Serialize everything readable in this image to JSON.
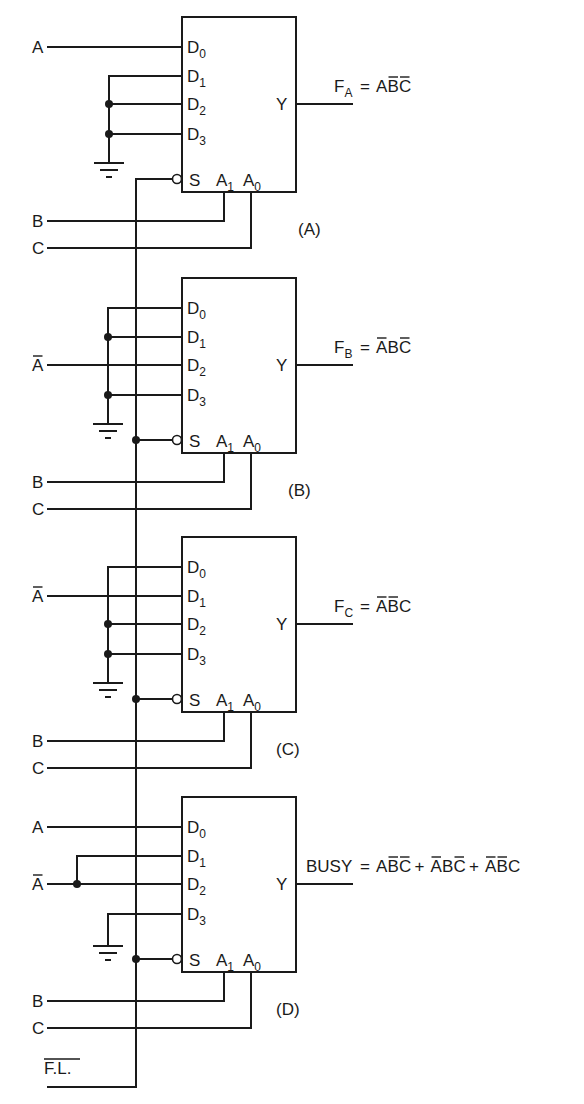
{
  "diagram": {
    "type": "multiplexer-logic-circuit",
    "bus_signal": "F.L.",
    "bus_signal_overbar": true,
    "pin_labels": {
      "data": [
        "D",
        "D",
        "D",
        "D"
      ],
      "data_subs": [
        "0",
        "1",
        "2",
        "3"
      ],
      "output": "Y",
      "strobe": "S",
      "select_1": "A",
      "select_1_sub": "1",
      "select_0": "A",
      "select_0_sub": "0"
    },
    "blocks": [
      {
        "id": "A",
        "caption": "(A)",
        "inputs": [
          {
            "pin": "D0",
            "signal": "A",
            "overbar": false
          },
          {
            "pin": "D1",
            "signal": "GND"
          },
          {
            "pin": "D2",
            "signal": "GND"
          },
          {
            "pin": "D3",
            "signal": "GND"
          }
        ],
        "select": {
          "A1": "B",
          "A0": "C"
        },
        "output": {
          "name": "F",
          "sub": "A",
          "expr": [
            [
              {
                "t": "A",
                "bar": false
              },
              {
                "t": "B",
                "bar": true
              },
              {
                "t": "C",
                "bar": true
              }
            ]
          ]
        }
      },
      {
        "id": "B",
        "caption": "(B)",
        "inputs": [
          {
            "pin": "D0",
            "signal": "GND"
          },
          {
            "pin": "D1",
            "signal": "GND"
          },
          {
            "pin": "D2",
            "signal": "A",
            "overbar": true
          },
          {
            "pin": "D3",
            "signal": "GND"
          }
        ],
        "select": {
          "A1": "B",
          "A0": "C"
        },
        "output": {
          "name": "F",
          "sub": "B",
          "expr": [
            [
              {
                "t": "A",
                "bar": true
              },
              {
                "t": "B",
                "bar": false
              },
              {
                "t": "C",
                "bar": true
              }
            ]
          ]
        }
      },
      {
        "id": "C",
        "caption": "(C)",
        "inputs": [
          {
            "pin": "D0",
            "signal": "GND"
          },
          {
            "pin": "D1",
            "signal": "A",
            "overbar": true
          },
          {
            "pin": "D2",
            "signal": "GND"
          },
          {
            "pin": "D3",
            "signal": "GND"
          }
        ],
        "select": {
          "A1": "B",
          "A0": "C"
        },
        "output": {
          "name": "F",
          "sub": "C",
          "expr": [
            [
              {
                "t": "A",
                "bar": true
              },
              {
                "t": "B",
                "bar": true
              },
              {
                "t": "C",
                "bar": false
              }
            ]
          ]
        }
      },
      {
        "id": "D",
        "caption": "(D)",
        "inputs": [
          {
            "pin": "D0",
            "signal": "A",
            "overbar": false
          },
          {
            "pin": "D1",
            "signal": "A",
            "overbar": true
          },
          {
            "pin": "D2",
            "signal": "A",
            "overbar": true
          },
          {
            "pin": "D3",
            "signal": "GND"
          }
        ],
        "select": {
          "A1": "B",
          "A0": "C"
        },
        "output": {
          "name": "BUSY",
          "sub": "",
          "expr": [
            [
              {
                "t": "A",
                "bar": false
              },
              {
                "t": "B",
                "bar": true
              },
              {
                "t": "C",
                "bar": true
              }
            ],
            [
              {
                "t": "A",
                "bar": true
              },
              {
                "t": "B",
                "bar": false
              },
              {
                "t": "C",
                "bar": true
              }
            ],
            [
              {
                "t": "A",
                "bar": true
              },
              {
                "t": "B",
                "bar": true
              },
              {
                "t": "C",
                "bar": false
              }
            ]
          ]
        }
      }
    ]
  },
  "text": {
    "sig_A": "A",
    "sig_B": "B",
    "sig_C": "C",
    "sig_FL": "F.L.",
    "eq": "=",
    "plus": "+"
  }
}
